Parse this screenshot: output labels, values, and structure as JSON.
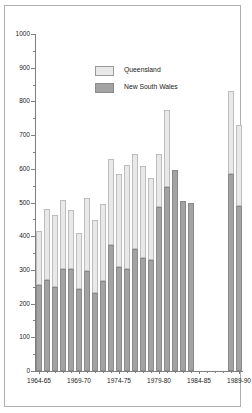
{
  "chart_data": {
    "type": "bar",
    "subtype": "stacked",
    "title": "",
    "xlabel": "",
    "ylabel": "",
    "ylim": [
      0,
      1000
    ],
    "ytick_step": 100,
    "yminor_step": 50,
    "grid": false,
    "legend_position": "top-left",
    "ytick_labels": [
      "0",
      "100",
      "200",
      "300",
      "400",
      "500",
      "600",
      "700",
      "800",
      "900",
      "1000"
    ],
    "xtick_labels": [
      "1964-65",
      "1969-70",
      "1974-75",
      "1979-80",
      "1984-85",
      "1989-90"
    ],
    "xtick_label_indices": [
      0,
      5,
      10,
      15,
      20,
      25
    ],
    "categories": [
      "1964-65",
      "1965-66",
      "1966-67",
      "1967-68",
      "1968-69",
      "1969-70",
      "1970-71",
      "1971-72",
      "1972-73",
      "1973-74",
      "1974-75",
      "1975-76",
      "1976-77",
      "1977-78",
      "1978-79",
      "1979-80",
      "1980-81",
      "1981-82",
      "1982-83",
      "1983-84",
      "1984-85",
      "1985-86",
      "1986-87",
      "1987-88",
      "1988-89",
      "1989-90"
    ],
    "series": [
      {
        "name": "New South Wales",
        "color": "#a3a3a3",
        "values": [
          255,
          270,
          248,
          302,
          304,
          244,
          297,
          231,
          268,
          375,
          309,
          303,
          363,
          334,
          328,
          487,
          545,
          597,
          505,
          500,
          null,
          null,
          null,
          null,
          585,
          489
        ]
      },
      {
        "name": "Queensland",
        "color": "#e9e9e9",
        "values": [
          161,
          210,
          215,
          206,
          173,
          167,
          217,
          218,
          227,
          253,
          275,
          308,
          280,
          274,
          245,
          156,
          229,
          0,
          0,
          0,
          null,
          null,
          null,
          null,
          247,
          242
        ]
      }
    ],
    "totals": [
      416,
      480,
      463,
      508,
      477,
      411,
      514,
      449,
      495,
      628,
      584,
      611,
      643,
      608,
      573,
      643,
      774,
      597,
      505,
      500,
      null,
      null,
      null,
      null,
      832,
      731
    ]
  },
  "legend": {
    "items": [
      {
        "label": "Queensland"
      },
      {
        "label": "New South Wales"
      }
    ]
  }
}
